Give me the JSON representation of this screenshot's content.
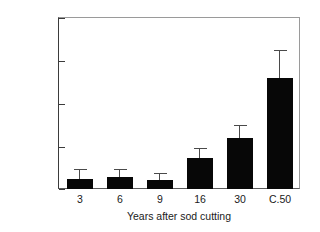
{
  "chart_data": {
    "type": "bar",
    "title": "",
    "xlabel": "Years after sod cutting",
    "ylabel": "N mineralization (g N m⁻² yr⁻¹)",
    "ylabel_parts": {
      "prefix": "N mineralization (g N m",
      "sup1": "-2",
      "mid": " yr",
      "sup2": "-1",
      "suffix": ")"
    },
    "categories": [
      "3",
      "6",
      "9",
      "16",
      "30",
      "C.50"
    ],
    "values": [
      1.2,
      1.4,
      1.1,
      3.6,
      5.9,
      12.9
    ],
    "errors_upper": [
      2.2,
      2.2,
      1.7,
      4.7,
      7.3,
      16.1
    ],
    "ylim": [
      0,
      20
    ],
    "yticks": [
      0,
      5,
      10,
      15,
      20
    ],
    "ytick_labels": [
      "0",
      "5",
      "10",
      "15",
      "20"
    ],
    "grid": false,
    "legend": "none",
    "bar_color": "#070707",
    "error_color": "#4a4a4a",
    "axis_color": "#3b3b3b",
    "frame_color": "#9a9a9a",
    "background": "#ffffff"
  }
}
